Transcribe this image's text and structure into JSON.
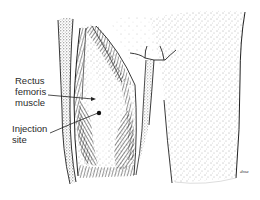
{
  "figure": {
    "labels": {
      "muscle": [
        "Rectus",
        "femoris",
        "muscle"
      ],
      "injection": [
        "Injection",
        "site"
      ]
    },
    "signature": "dma",
    "colors": {
      "ink": "#2a2a2a",
      "background": "#ffffff",
      "stipple": "#555555"
    }
  }
}
